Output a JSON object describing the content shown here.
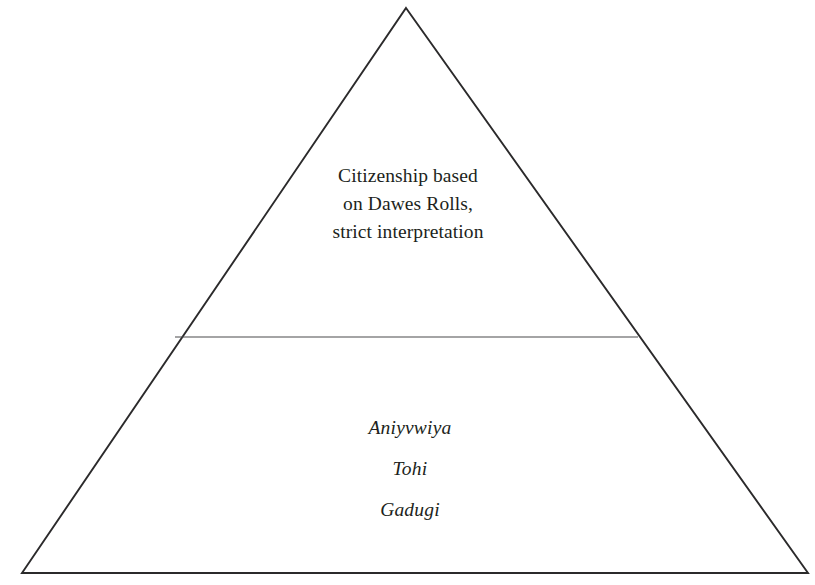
{
  "diagram": {
    "type": "pyramid",
    "title": "",
    "background_color": "#ffffff",
    "outline_color": "#2b2a2b",
    "divider_color": "#4a4a4c",
    "text_color": "#211f20",
    "geometry": {
      "apex": [
        406,
        8
      ],
      "bottom_left": [
        22,
        573
      ],
      "bottom_right": [
        808,
        573
      ],
      "divider_left": [
        175,
        337
      ],
      "divider_right": [
        638,
        337
      ]
    },
    "tiers": [
      {
        "id": "upper",
        "name": "upper-tier",
        "style": "roman",
        "lines": [
          "Citizenship based",
          "on Dawes Rolls,",
          "strict interpretation"
        ]
      },
      {
        "id": "lower",
        "name": "lower-tier",
        "style": "italic",
        "lines": [
          "Aniyvwiya",
          "Tohi",
          "Gadugi"
        ]
      }
    ]
  }
}
